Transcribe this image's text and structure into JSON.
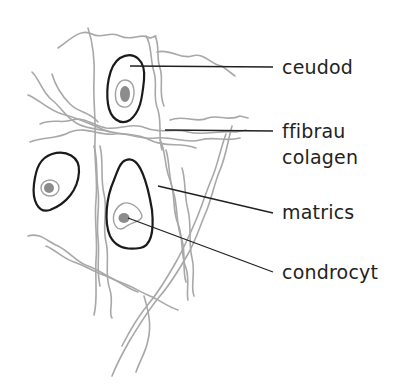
{
  "diagram": {
    "labels": [
      {
        "id": "cell",
        "text": "ceudod"
      },
      {
        "id": "fibres-1",
        "text": "ffibrau"
      },
      {
        "id": "fibres-2",
        "text": "colagen"
      },
      {
        "id": "matrix",
        "text": "matrics"
      },
      {
        "id": "chondrocyte",
        "text": "condrocyt"
      }
    ],
    "colors": {
      "fibre": "#a8a8a8",
      "cell_outline": "#1a1a1a",
      "nucleus_fill": "#8c8c8c",
      "nucleus_ring": "#a0a0a0",
      "leader_line": "#231f20",
      "text": "#231f20"
    }
  }
}
